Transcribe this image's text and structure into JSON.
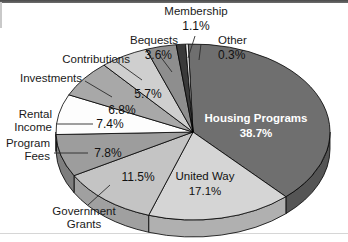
{
  "chart_data": {
    "type": "pie",
    "title": "",
    "subtitle": "",
    "xlabel": "",
    "ylabel": "",
    "legend_position": "callout-labels",
    "grid": false,
    "three_d": true,
    "categories": [
      "Housing Programs",
      "United Way",
      "Government Grants",
      "Program Fees",
      "Rental Income",
      "Investments",
      "Contributions",
      "Bequests",
      "Membership",
      "Other"
    ],
    "values": [
      38.7,
      17.1,
      11.5,
      7.8,
      7.4,
      6.8,
      5.7,
      3.6,
      1.1,
      0.3
    ],
    "value_labels": [
      "38.7%",
      "17.1%",
      "11.5%",
      "7.8%",
      "7.4%",
      "6.8%",
      "5.7%",
      "3.6%",
      "1.1%",
      "0.3%"
    ],
    "units": "%",
    "total": 100.0,
    "slices": [
      {
        "name": "Housing Programs",
        "value": 38.7,
        "label": "38.7%",
        "color": "#6f6f6f",
        "side_color": "#555555",
        "label_placement": "inside",
        "label_style": "bold-white"
      },
      {
        "name": "United Way",
        "value": 17.1,
        "label": "17.1%",
        "color": "#d5d5d5",
        "side_color": "#b0b0b0",
        "label_placement": "inside",
        "label_style": "plain-dark"
      },
      {
        "name": "Government Grants",
        "value": 11.5,
        "label": "11.5%",
        "color": "#c4c4c4",
        "side_color": "#a0a0a0",
        "label_placement": "callout",
        "label_style": "plain-dark"
      },
      {
        "name": "Program Fees",
        "value": 7.8,
        "label": "7.8%",
        "color": "#9d9d9d",
        "side_color": "#7e7e7e",
        "label_placement": "callout",
        "label_style": "plain-dark"
      },
      {
        "name": "Rental Income",
        "value": 7.4,
        "label": "7.4%",
        "color": "#fdfdfd",
        "side_color": "#d8d8d8",
        "label_placement": "callout",
        "label_style": "plain-dark"
      },
      {
        "name": "Investments",
        "value": 6.8,
        "label": "6.8%",
        "color": "#a8a8a8",
        "side_color": "#8a8a8a",
        "label_placement": "callout",
        "label_style": "plain-dark"
      },
      {
        "name": "Contributions",
        "value": 5.7,
        "label": "5.7%",
        "color": "#cfcfcf",
        "side_color": "#aaaaaa",
        "label_placement": "callout",
        "label_style": "plain-dark"
      },
      {
        "name": "Bequests",
        "value": 3.6,
        "label": "3.6%",
        "color": "#8e8e8e",
        "side_color": "#737373",
        "label_placement": "callout",
        "label_style": "plain-dark"
      },
      {
        "name": "Membership",
        "value": 1.1,
        "label": "1.1%",
        "color": "#3a3a3a",
        "side_color": "#2b2b2b",
        "label_placement": "callout",
        "label_style": "plain-dark"
      },
      {
        "name": "Other",
        "value": 0.3,
        "label": "0.3%",
        "color": "#f5f5f5",
        "side_color": "#cccccc",
        "label_placement": "callout",
        "label_style": "plain-dark"
      }
    ]
  },
  "labels": {
    "membership_name": "Membership",
    "membership_pct": "1.1%",
    "other_name": "Other",
    "other_pct": "0.3%",
    "bequests_name": "Bequests",
    "bequests_pct": "3.6%",
    "contributions_name": "Contributions",
    "contributions_pct": "5.7%",
    "investments_name": "Investments",
    "investments_pct": "6.8%",
    "rental_name_line1": "Rental",
    "rental_name_line2": "Income",
    "rental_pct": "7.4%",
    "program_name_line1": "Program",
    "program_name_line2": "Fees",
    "program_pct": "7.8%",
    "grants_name_line1": "Government",
    "grants_name_line2": "Grants",
    "grants_pct": "11.5%",
    "housing_name": "Housing Programs",
    "housing_pct": "38.7%",
    "unitedway_name": "United Way",
    "unitedway_pct": "17.1%"
  },
  "colors": {
    "housing": "#6f6f6f",
    "united_way": "#d5d5d5",
    "government_grants": "#c4c4c4",
    "program_fees": "#9d9d9d",
    "rental_income": "#fdfdfd",
    "investments": "#a8a8a8",
    "contributions": "#cfcfcf",
    "bequests": "#8e8e8e",
    "membership": "#3a3a3a",
    "other": "#f5f5f5",
    "background": "#ffffff",
    "outline": "#000000",
    "text": "#111111"
  }
}
